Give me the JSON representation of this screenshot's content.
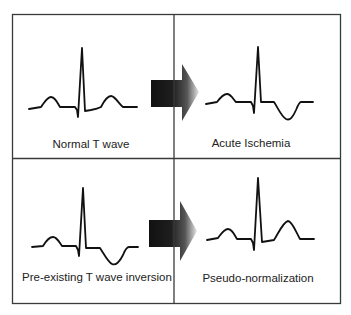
{
  "colors": {
    "border": "#3a3a3a",
    "trace": "#111111",
    "text": "#222222",
    "arrow_dark": "#1a1a1a",
    "arrow_light": "#ffffff",
    "background": "#ffffff"
  },
  "panels": [
    {
      "id": "normal",
      "label": "Normal T wave",
      "position": "top-left",
      "t_wave": "upright"
    },
    {
      "id": "acute-ischemia",
      "label": "Acute Ischemia",
      "position": "top-right",
      "t_wave": "inverted"
    },
    {
      "id": "pre-existing-inversion",
      "label": "Pre-existing T wave inversion",
      "position": "bottom-left",
      "t_wave": "inverted"
    },
    {
      "id": "pseudo-normalization",
      "label": "Pseudo-normalization",
      "position": "bottom-right",
      "t_wave": "upright"
    }
  ],
  "arrows": [
    {
      "from": "normal",
      "to": "acute-ischemia",
      "direction": "right"
    },
    {
      "from": "pre-existing-inversion",
      "to": "pseudo-normalization",
      "direction": "right"
    }
  ]
}
